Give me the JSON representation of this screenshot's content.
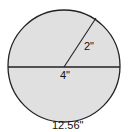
{
  "diagram": {
    "shape": "circle",
    "fill_color": "#e0e0e0",
    "stroke_color": "#222222",
    "radius_label": "2\"",
    "diameter_label": "4\"",
    "circumference_label": "12.56\""
  }
}
